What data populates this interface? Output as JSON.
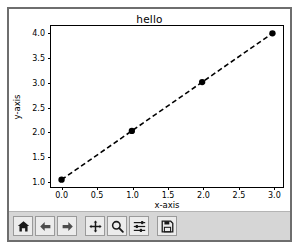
{
  "window": {
    "type": "matplotlib-figure-window"
  },
  "chart_data": {
    "type": "line",
    "title": "hello",
    "xlabel": "x-axis",
    "ylabel": "y-axis",
    "x": [
      0,
      1,
      2,
      3
    ],
    "y": [
      1,
      2,
      3,
      4
    ],
    "series": [
      {
        "name": "",
        "x": [
          0,
          1,
          2,
          3
        ],
        "values": [
          1,
          2,
          3,
          4
        ],
        "linestyle": "dashed",
        "marker": "circle",
        "color": "#000000"
      }
    ],
    "xlim": [
      -0.15,
      3.15
    ],
    "ylim": [
      0.85,
      4.15
    ],
    "xticks": [
      0.0,
      0.5,
      1.0,
      1.5,
      2.0,
      2.5,
      3.0
    ],
    "xticklabels": [
      "0.0",
      "0.5",
      "1.0",
      "1.5",
      "2.0",
      "2.5",
      "3.0"
    ],
    "yticks": [
      1.0,
      1.5,
      2.0,
      2.5,
      3.0,
      3.5,
      4.0
    ],
    "yticklabels": [
      "1.0",
      "1.5",
      "2.0",
      "2.5",
      "3.0",
      "3.5",
      "4.0"
    ],
    "grid": false,
    "legend": null
  },
  "toolbar": {
    "buttons": [
      {
        "name": "home-icon",
        "tooltip": "Home"
      },
      {
        "name": "back-arrow-icon",
        "tooltip": "Back"
      },
      {
        "name": "forward-arrow-icon",
        "tooltip": "Forward"
      },
      {
        "name": "pan-move-icon",
        "tooltip": "Pan"
      },
      {
        "name": "zoom-magnifier-icon",
        "tooltip": "Zoom to rectangle"
      },
      {
        "name": "subplot-sliders-icon",
        "tooltip": "Configure subplots"
      },
      {
        "name": "save-floppy-icon",
        "tooltip": "Save the figure"
      }
    ]
  },
  "colors": {
    "window_border": "#6e6e6e",
    "canvas": "#ffffff",
    "toolbar_bg": "#d6d6d6",
    "button_bg": "#ececec",
    "button_border": "#9a9a9a",
    "ink": "#000000"
  }
}
